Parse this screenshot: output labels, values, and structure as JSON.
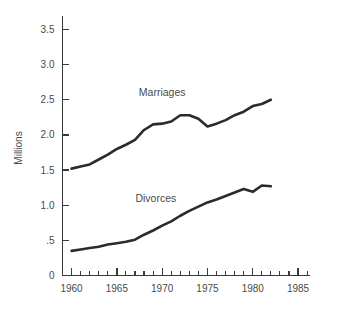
{
  "chart_data": {
    "type": "line",
    "title": "",
    "subtitle": "",
    "xlabel": "",
    "ylabel": "Millions",
    "xlim": [
      1959,
      1986
    ],
    "ylim": [
      0,
      3.75
    ],
    "grid": false,
    "legend_position": "inline-labels",
    "x_tick_labels": [
      "1960",
      "1965",
      "1970",
      "1975",
      "1980",
      "1985"
    ],
    "x_tick_values": [
      1960,
      1965,
      1970,
      1975,
      1980,
      1985
    ],
    "x_minor_tick_values": [
      1961,
      1962,
      1963,
      1964,
      1966,
      1967,
      1968,
      1969,
      1971,
      1972,
      1973,
      1974,
      1976,
      1977,
      1978,
      1979,
      1981,
      1982,
      1983,
      1984,
      1986
    ],
    "y_tick_labels": [
      "0",
      ".5",
      "1.0",
      "1.5",
      "2.0",
      "2.5",
      "3.0",
      "3.5"
    ],
    "y_tick_values": [
      0,
      0.5,
      1.0,
      1.5,
      2.0,
      2.5,
      3.0,
      3.5
    ],
    "x": [
      1960,
      1961,
      1962,
      1963,
      1964,
      1965,
      1966,
      1967,
      1968,
      1969,
      1970,
      1971,
      1972,
      1973,
      1974,
      1975,
      1976,
      1977,
      1978,
      1979,
      1980,
      1981,
      1982
    ],
    "series": [
      {
        "name": "Marriages",
        "label": "Marriages",
        "label_x": 1970.0,
        "label_y": 2.56,
        "color": "#2b2b2b",
        "values": [
          1.52,
          1.55,
          1.58,
          1.65,
          1.72,
          1.8,
          1.86,
          1.93,
          2.07,
          2.15,
          2.16,
          2.19,
          2.28,
          2.28,
          2.23,
          2.12,
          2.16,
          2.21,
          2.28,
          2.33,
          2.41,
          2.44,
          2.5
        ]
      },
      {
        "name": "Divorces",
        "label": "Divorces",
        "label_x": 1969.3,
        "label_y": 1.05,
        "color": "#2b2b2b",
        "values": [
          0.35,
          0.37,
          0.39,
          0.41,
          0.44,
          0.46,
          0.48,
          0.51,
          0.58,
          0.64,
          0.71,
          0.77,
          0.85,
          0.92,
          0.98,
          1.04,
          1.08,
          1.13,
          1.18,
          1.23,
          1.19,
          1.28,
          1.27
        ]
      }
    ]
  },
  "axis": {
    "y_title": "Millions"
  }
}
